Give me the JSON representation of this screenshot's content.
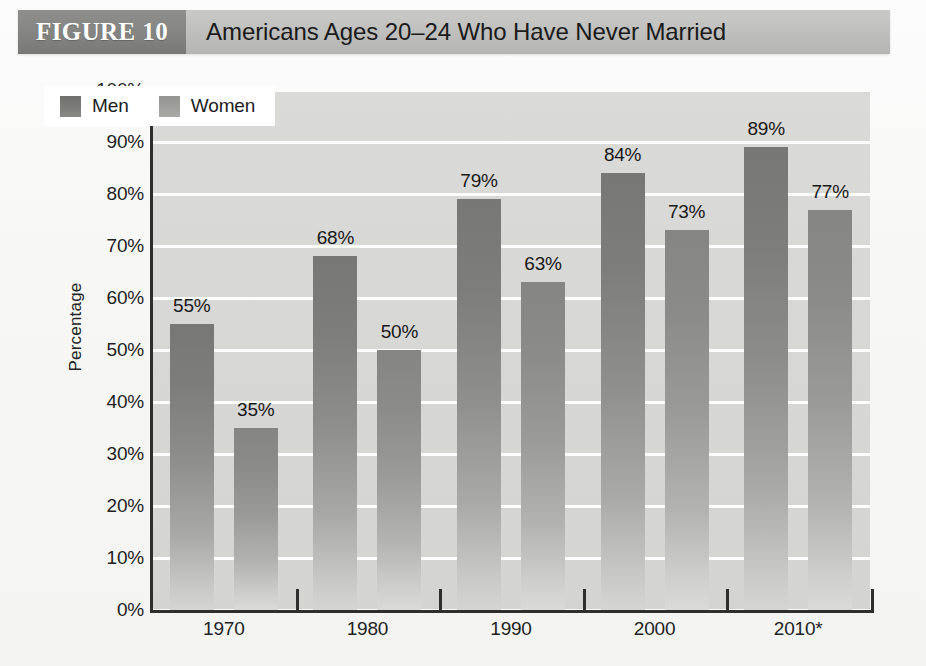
{
  "header": {
    "figure_tag": "FIGURE 10",
    "title": "Americans Ages 20–24 Who Have Never Married"
  },
  "chart_data": {
    "type": "bar",
    "title": "Americans Ages 20–24 Who Have Never Married",
    "xlabel": "",
    "ylabel": "Percentage",
    "ylim": [
      0,
      100
    ],
    "y_ticks": [
      "0%",
      "10%",
      "20%",
      "30%",
      "40%",
      "50%",
      "60%",
      "70%",
      "80%",
      "90%",
      "100%"
    ],
    "y_tick_values": [
      0,
      10,
      20,
      30,
      40,
      50,
      60,
      70,
      80,
      90,
      100
    ],
    "grid": true,
    "legend_position": "top-left",
    "categories": [
      "1970",
      "1980",
      "1990",
      "2000",
      "2010*"
    ],
    "series": [
      {
        "name": "Men",
        "color": "#7c7c7a",
        "values": [
          55,
          68,
          79,
          84,
          89
        ],
        "labels": [
          "55%",
          "68%",
          "79%",
          "84%",
          "89%"
        ]
      },
      {
        "name": "Women",
        "color": "#9f9f9d",
        "values": [
          35,
          50,
          63,
          73,
          77
        ],
        "labels": [
          "35%",
          "50%",
          "63%",
          "73%",
          "77%"
        ]
      }
    ]
  },
  "colors": {
    "title_band": "#bebebc",
    "figure_tag_band": "#84847f",
    "plot_background": "#d7d7d5",
    "gridline": "#fdfdfd",
    "axis": "#2e2e2e",
    "men_bar": "#7c7c7a",
    "women_bar": "#9f9f9d"
  }
}
